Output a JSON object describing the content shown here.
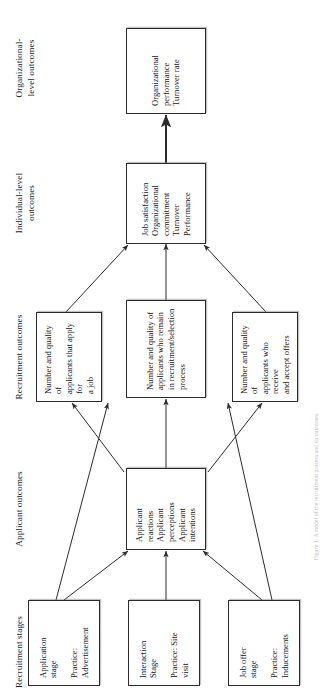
{
  "figure": {
    "type": "flowchart",
    "orientation": "rotated-90-ccw",
    "caption": "Figure 1. A model of the recruitment process and its outcomes."
  },
  "columns": [
    {
      "id": "recruitment-stages",
      "label": "Recruitment stages"
    },
    {
      "id": "applicant-outcomes",
      "label": "Applicant outcomes"
    },
    {
      "id": "recruitment-outcomes",
      "label": "Recruitment outcomes"
    },
    {
      "id": "individual-level",
      "label": "Individual-level\noutcomes"
    },
    {
      "id": "organizational-level",
      "label": "Organizational-\nlevel outcomes"
    }
  ],
  "nodes": [
    {
      "id": "application-stage",
      "column": "recruitment-stages",
      "text": "Application\nstage\n\nPractice:\nAdvertisement"
    },
    {
      "id": "interaction-stage",
      "column": "recruitment-stages",
      "text": "Interaction\nStage\n\nPractice: Site\nvisit"
    },
    {
      "id": "job-offer-stage",
      "column": "recruitment-stages",
      "text": "Job offer\nstage\n\nPractice:\nInducements"
    },
    {
      "id": "applicant-outcomes-box",
      "column": "applicant-outcomes",
      "text": "Applicant reactions\nApplicant perceptions\nApplicant intentions"
    },
    {
      "id": "applicants-apply",
      "column": "recruitment-outcomes",
      "text": "Number and quality of\napplicants that apply for\na job"
    },
    {
      "id": "applicants-remain",
      "column": "recruitment-outcomes",
      "text": "Number and quality of\napplicants who remain\nin recruitment/selection\nprocess"
    },
    {
      "id": "applicants-accept",
      "column": "recruitment-outcomes",
      "text": "Number and quality of\napplicants who receive\nand accept offers"
    },
    {
      "id": "individual-outcomes-box",
      "column": "individual-level",
      "text": "Job satisfaction\nOrganizational\ncommitment\nTurnover\nPerformance"
    },
    {
      "id": "organizational-outcomes-box",
      "column": "organizational-level",
      "text": "Organizational\nperformance\nTurnover rate"
    }
  ],
  "edges": [
    {
      "from": "application-stage",
      "to": "applicant-outcomes-box"
    },
    {
      "from": "interaction-stage",
      "to": "applicant-outcomes-box"
    },
    {
      "from": "job-offer-stage",
      "to": "applicant-outcomes-box"
    },
    {
      "from": "applicant-outcomes-box",
      "to": "applicants-apply"
    },
    {
      "from": "applicant-outcomes-box",
      "to": "applicants-remain"
    },
    {
      "from": "applicant-outcomes-box",
      "to": "applicants-accept"
    },
    {
      "from": "application-stage",
      "to": "applicants-apply"
    },
    {
      "from": "job-offer-stage",
      "to": "applicants-accept"
    },
    {
      "from": "applicants-apply",
      "to": "individual-outcomes-box"
    },
    {
      "from": "applicants-remain",
      "to": "individual-outcomes-box"
    },
    {
      "from": "applicants-accept",
      "to": "individual-outcomes-box"
    },
    {
      "from": "individual-outcomes-box",
      "to": "organizational-outcomes-box"
    }
  ],
  "colors": {
    "box_border": "#2b2b2b",
    "edge": "#2b2b2b",
    "text": "#141414",
    "background": "#ffffff"
  }
}
